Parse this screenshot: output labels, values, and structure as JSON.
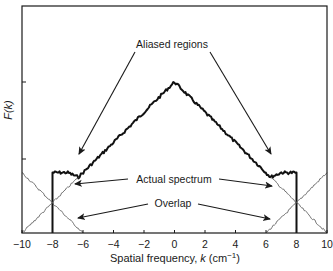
{
  "chart_data": {
    "type": "line",
    "title": "",
    "xlabel": "Spatial frequency, k (cm−1)",
    "xlabel_parts": {
      "main": "Spatial frequency, ",
      "var": "k",
      "unit_open": " (cm",
      "exp": "−1",
      "unit_close": ")"
    },
    "ylabel": "F(k)",
    "xlim": [
      -10,
      10
    ],
    "ylim": [
      0,
      1.5
    ],
    "grid": false,
    "x_ticks": [
      -10,
      -8,
      -6,
      -4,
      -2,
      0,
      2,
      4,
      6,
      8,
      10
    ],
    "x_tick_labels": [
      "−10",
      "−8",
      "−6",
      "−4",
      "−2",
      "0",
      "2",
      "4",
      "6",
      "8",
      "10"
    ],
    "y_ticks": [
      0.5,
      1.0
    ],
    "y_tick_labels": [
      "",
      ""
    ],
    "series": [
      {
        "name": "Actual spectrum (band-limited sum)",
        "style": "thick",
        "x": [
          -8,
          -8,
          -7,
          -6.3,
          -4,
          -2,
          0,
          2,
          4,
          6.3,
          7,
          8,
          8
        ],
        "values": [
          0,
          0.4,
          0.4,
          0.37,
          0.6,
          0.8,
          1.0,
          0.8,
          0.6,
          0.37,
          0.4,
          0.4,
          0
        ]
      },
      {
        "name": "Original spectrum tail (left)",
        "style": "thin",
        "x": [
          -10,
          -6.3
        ],
        "values": [
          0,
          0.37
        ]
      },
      {
        "name": "Alias centered at k=-16",
        "style": "thin",
        "x": [
          -10,
          -6
        ],
        "values": [
          0.4,
          0
        ]
      },
      {
        "name": "Original spectrum tail (right)",
        "style": "thin",
        "x": [
          6.3,
          10
        ],
        "values": [
          0.37,
          0
        ]
      },
      {
        "name": "Alias centered at k=+16",
        "style": "thin",
        "x": [
          6,
          10
        ],
        "values": [
          0,
          0.4
        ]
      }
    ],
    "annotations": [
      {
        "text": "Aliased regions",
        "arrows_to": [
          [
            -7.0,
            0.42
          ],
          [
            7.0,
            0.42
          ]
        ]
      },
      {
        "text": "Actual spectrum",
        "arrows_to": [
          [
            -6.8,
            0.33
          ],
          [
            6.8,
            0.33
          ]
        ]
      },
      {
        "text": "Overlap",
        "arrows_to": [
          [
            -6.8,
            0.1
          ],
          [
            6.8,
            0.1
          ]
        ]
      }
    ]
  }
}
